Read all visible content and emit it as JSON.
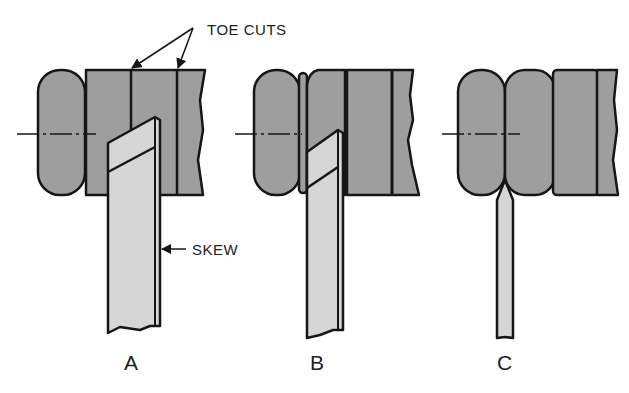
{
  "figure": {
    "colors": {
      "stock": "#9e9e9e",
      "tool": "#d6d6d6",
      "outline": "#161616",
      "text": "#222222",
      "background": "#ffffff"
    }
  },
  "callouts": {
    "toe_cuts": "TOE CUTS",
    "skew": "SKEW"
  },
  "panels": [
    {
      "label": "A",
      "stage": "Skew making toe cuts on cylinder beside rounded bead"
    },
    {
      "label": "B",
      "stage": "Skew rounding the next bead after toe cuts"
    },
    {
      "label": "C",
      "stage": "Parting tool cut between completed beads"
    }
  ]
}
